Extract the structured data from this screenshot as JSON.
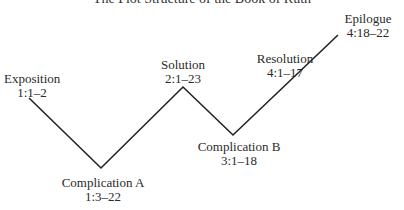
{
  "title": "The Plot Structure of the Book of Ruth",
  "nodes": [
    {
      "name": "Exposition",
      "ref": "1:1–2"
    },
    {
      "name": "Complication A",
      "ref": "1:3–22"
    },
    {
      "name": "Solution",
      "ref": "2:1–23"
    },
    {
      "name": "Complication B",
      "ref": "3:1–18"
    },
    {
      "name": "Resolution",
      "ref": "4:1–17"
    },
    {
      "name": "Epilogue",
      "ref": "4:18–22"
    }
  ],
  "line_color": "#222222"
}
